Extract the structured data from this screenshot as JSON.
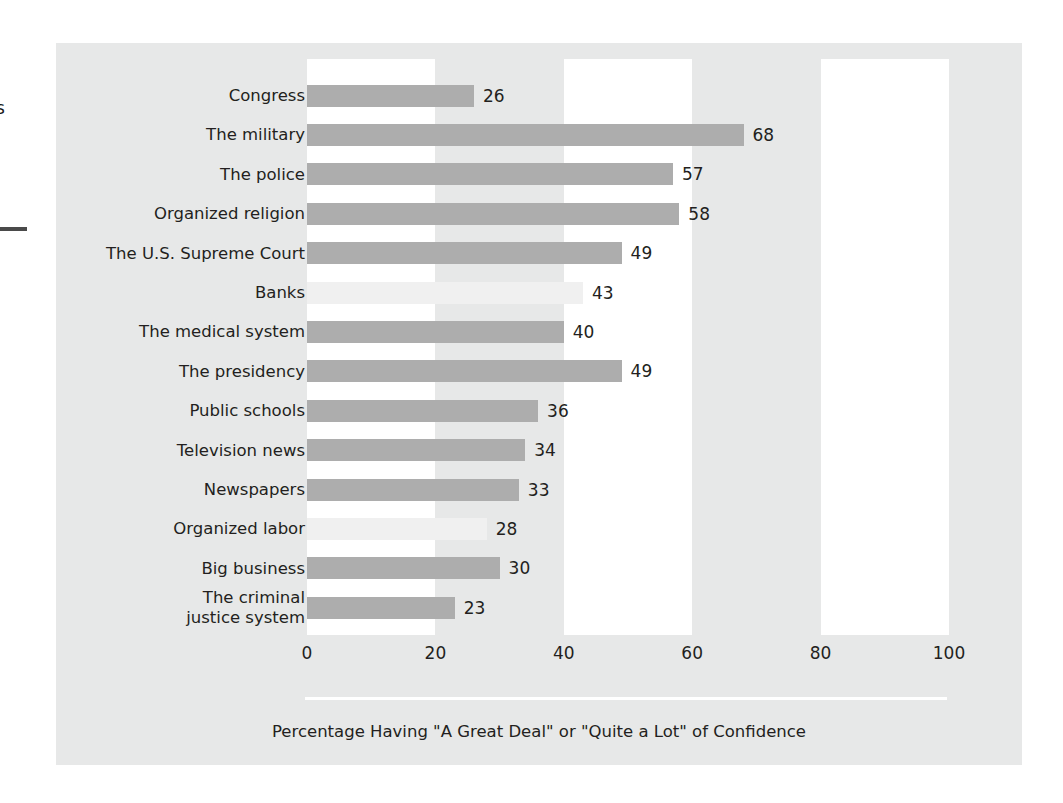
{
  "figure": {
    "caption": "Percentage Having \"A Great Deal\" or \"Quite a Lot\" of Confidence",
    "panel_background": "#e7e8e8",
    "band_color": "#ffffff",
    "bar_color": "#adadad",
    "bar_color_light": "#f0f0f0",
    "text_color": "#231f20"
  },
  "page_artifacts": {
    "edge_glyph": "s"
  },
  "chart_data": {
    "type": "bar",
    "orientation": "horizontal",
    "title": "",
    "subtitle": "",
    "xlabel": "Percentage Having \"A Great Deal\" or \"Quite a Lot\" of Confidence",
    "ylabel": "",
    "xlim": [
      0,
      100
    ],
    "xticks": [
      0,
      20,
      40,
      60,
      80,
      100
    ],
    "xtick_labels": [
      "0",
      "20",
      "40",
      "60",
      "80",
      "100"
    ],
    "grid": false,
    "legend": null,
    "value_labels_shown": true,
    "categories": [
      "Congress",
      "The military",
      "The police",
      "Organized religion",
      "The U.S. Supreme Court",
      "Banks",
      "The medical system",
      "The presidency",
      "Public schools",
      "Television news",
      "Newspapers",
      "Organized labor",
      "Big business",
      "The criminal\njustice system"
    ],
    "values": [
      26,
      68,
      57,
      58,
      49,
      43,
      40,
      49,
      36,
      34,
      33,
      28,
      30,
      23
    ],
    "bar_shades": [
      "normal",
      "normal",
      "normal",
      "normal",
      "normal",
      "light",
      "normal",
      "normal",
      "normal",
      "normal",
      "normal",
      "light",
      "normal",
      "normal"
    ]
  }
}
